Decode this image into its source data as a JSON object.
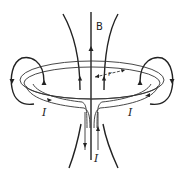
{
  "diagram": {
    "type": "magnetic field of a current loop with feed wires",
    "labels": {
      "field": "B",
      "current_left": "I",
      "current_right": "I",
      "current_bottom": "I",
      "radius": "r"
    },
    "colors": {
      "line": "#222222",
      "background": "#ffffff"
    }
  }
}
